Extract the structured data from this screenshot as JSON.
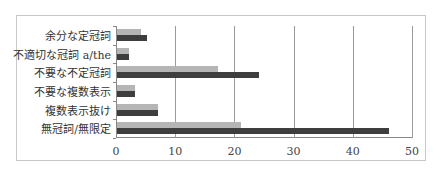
{
  "chart_data": {
    "type": "bar",
    "orientation": "horizontal",
    "title": "",
    "xlabel": "",
    "ylabel": "",
    "xlim": [
      0,
      50
    ],
    "x_ticks": [
      "0",
      "10",
      "20",
      "30",
      "40",
      "50"
    ],
    "grid": true,
    "legend": null,
    "categories": [
      "余分な定冠詞",
      "不適切な冠詞 a/the",
      "不要な不定冠詞",
      "不要な複数表示",
      "複数表示抜け",
      "無冠詞/無限定"
    ],
    "series": [
      {
        "name": "series-light",
        "color": "#b5b5b5",
        "values": [
          4,
          2,
          17,
          3,
          7,
          21
        ]
      },
      {
        "name": "series-dark",
        "color": "#3e3e3e",
        "values": [
          5,
          2,
          24,
          3,
          7,
          46
        ]
      }
    ]
  }
}
